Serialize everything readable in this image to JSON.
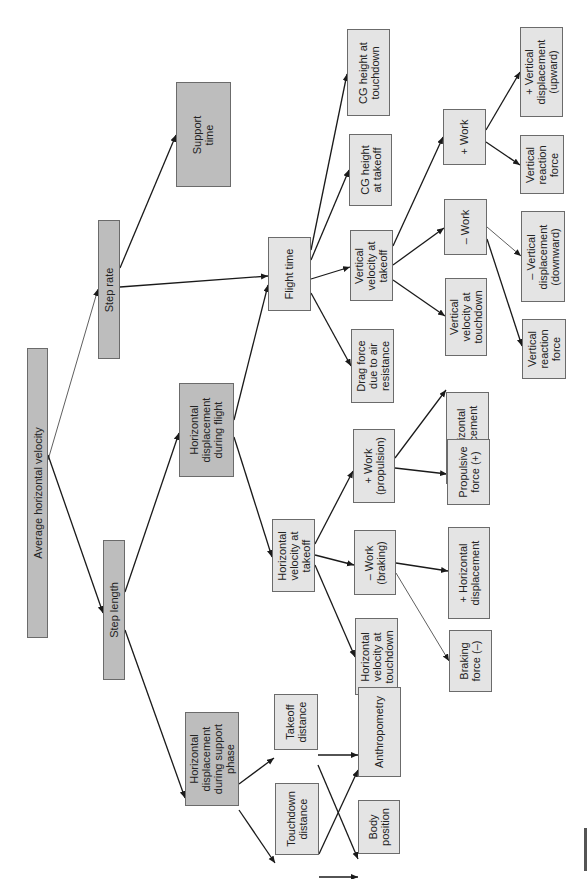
{
  "diagram": {
    "title": "Average horizontal velocity",
    "colors": {
      "primary_fill": "#bdbdbd",
      "secondary_fill": "#e4e4e4",
      "border": "#6b6b6b",
      "edge": "#1a1a1a"
    },
    "orientation": "rotated 90deg counter-clockwise (root at left, leaves at right)",
    "nodes": [
      {
        "id": "avg_h_vel",
        "label": "Average horizontal velocity",
        "style": "dark",
        "x": 27,
        "y": 348,
        "w": 21,
        "h": 290
      },
      {
        "id": "step_rate",
        "label": "Step rate",
        "style": "dark",
        "x": 98,
        "y": 220,
        "w": 22,
        "h": 139
      },
      {
        "id": "step_length",
        "label": "Step length",
        "style": "dark",
        "x": 103,
        "y": 540,
        "w": 22,
        "h": 140
      },
      {
        "id": "support_time",
        "label": "Support\ntime",
        "style": "dark",
        "x": 176,
        "y": 82,
        "w": 55,
        "h": 105
      },
      {
        "id": "hd_flight",
        "label": "Horizontal\ndisplacement\nduring flight",
        "style": "dark",
        "x": 179,
        "y": 383,
        "w": 55,
        "h": 94
      },
      {
        "id": "hd_support",
        "label": "Horizontal\ndisplacement\nduring support\nphase",
        "style": "dark",
        "x": 185,
        "y": 712,
        "w": 54,
        "h": 94
      },
      {
        "id": "flight_time",
        "label": "Flight time",
        "style": "light",
        "x": 268,
        "y": 237,
        "w": 43,
        "h": 74
      },
      {
        "id": "hv_takeoff",
        "label": "Horizontal\nvelocity at\ntakeoff",
        "style": "light",
        "x": 272,
        "y": 519,
        "w": 43,
        "h": 73
      },
      {
        "id": "takeoff_dist",
        "label": "Takeoff\ndistance",
        "style": "light",
        "x": 274,
        "y": 694,
        "w": 44,
        "h": 56
      },
      {
        "id": "touchdown_dist",
        "label": "Touchdown\ndistance",
        "style": "light",
        "x": 275,
        "y": 783,
        "w": 44,
        "h": 72
      },
      {
        "id": "cg_touchdown",
        "label": "CG height at\ntouchdown",
        "style": "light",
        "x": 347,
        "y": 29,
        "w": 43,
        "h": 87
      },
      {
        "id": "cg_takeoff",
        "label": "CG height\nat takeoff",
        "style": "light",
        "x": 349,
        "y": 134,
        "w": 43,
        "h": 72
      },
      {
        "id": "vv_takeoff",
        "label": "Vertical\nvelocity at\ntakeoff",
        "style": "light",
        "x": 350,
        "y": 230,
        "w": 43,
        "h": 71
      },
      {
        "id": "drag",
        "label": "Drag force\ndue to air\nresistance",
        "style": "light",
        "x": 351,
        "y": 329,
        "w": 43,
        "h": 74
      },
      {
        "id": "work_prop",
        "label": "+ Work\n(propulsion)",
        "style": "light",
        "x": 353,
        "y": 429,
        "w": 42,
        "h": 74
      },
      {
        "id": "work_brake",
        "label": "– Work\n(braking)",
        "style": "light",
        "x": 354,
        "y": 530,
        "w": 42,
        "h": 65
      },
      {
        "id": "hv_touchdown",
        "label": "Horizontal\nvelocity at\ntouchdown",
        "style": "light",
        "x": 355,
        "y": 618,
        "w": 43,
        "h": 77
      },
      {
        "id": "anthropometry",
        "label": "Anthropometry",
        "style": "light",
        "x": 358,
        "y": 687,
        "w": 43,
        "h": 90
      },
      {
        "id": "body_position",
        "label": "Body\nposition",
        "style": "light",
        "x": 358,
        "y": 800,
        "w": 42,
        "h": 54
      },
      {
        "id": "work_plus_v",
        "label": "+ Work",
        "style": "light",
        "x": 443,
        "y": 109,
        "w": 43,
        "h": 56
      },
      {
        "id": "work_minus_v",
        "label": "– Work",
        "style": "light",
        "x": 444,
        "y": 199,
        "w": 43,
        "h": 56
      },
      {
        "id": "vv_touchdown",
        "label": "Vertical\nvelocity at\ntouchdown",
        "style": "light",
        "x": 445,
        "y": 278,
        "w": 42,
        "h": 78
      },
      {
        "id": "plus_hd_1",
        "label": "+ Horizontal\ndisplacement",
        "style": "light",
        "x": 446,
        "y": 392,
        "w": 43,
        "h": 92
      },
      {
        "id": "propulsive_force",
        "label": "Propulsive\nforce (+)",
        "style": "light",
        "x": 447,
        "y": 439,
        "w": 43,
        "h": 66
      },
      {
        "id": "plus_hd_2",
        "label": "+ Horizontal\ndisplacement",
        "style": "light",
        "x": 448,
        "y": 527,
        "w": 42,
        "h": 92
      },
      {
        "id": "braking_force",
        "label": "Braking\nforce (–)",
        "style": "light",
        "x": 449,
        "y": 630,
        "w": 43,
        "h": 62
      },
      {
        "id": "plus_vd_up",
        "label": "+ Vertical\ndisplacement\n(upward)",
        "style": "light",
        "x": 520,
        "y": 27,
        "w": 43,
        "h": 90
      },
      {
        "id": "vrf_1",
        "label": "Vertical\nreaction\nforce",
        "style": "light",
        "x": 520,
        "y": 135,
        "w": 44,
        "h": 59
      },
      {
        "id": "minus_vd_down",
        "label": "– Vertical\ndisplacement\n(downward)",
        "style": "light",
        "x": 521,
        "y": 211,
        "w": 44,
        "h": 91
      },
      {
        "id": "vrf_2",
        "label": "Vertical\nreaction\nforce",
        "style": "light",
        "x": 522,
        "y": 319,
        "w": 44,
        "h": 60
      }
    ],
    "edges": [
      {
        "from": "avg_h_vel",
        "to": "step_rate",
        "x1": 48,
        "y1": 460,
        "x2": 98,
        "y2": 289,
        "thin": true
      },
      {
        "from": "avg_h_vel",
        "to": "step_length",
        "x1": 48,
        "y1": 455,
        "x2": 103,
        "y2": 613
      },
      {
        "from": "step_rate",
        "to": "support_time",
        "x1": 120,
        "y1": 268,
        "x2": 176,
        "y2": 135
      },
      {
        "from": "step_rate",
        "to": "flight_time",
        "x1": 120,
        "y1": 287,
        "x2": 268,
        "y2": 276
      },
      {
        "from": "hd_flight",
        "to": "flight_time",
        "x1": 234,
        "y1": 420,
        "x2": 268,
        "y2": 285
      },
      {
        "from": "step_length",
        "to": "hd_flight",
        "x1": 125,
        "y1": 592,
        "x2": 179,
        "y2": 433
      },
      {
        "from": "step_length",
        "to": "hd_support",
        "x1": 125,
        "y1": 630,
        "x2": 185,
        "y2": 798
      },
      {
        "from": "hd_flight",
        "to": "hv_takeoff",
        "x1": 234,
        "y1": 437,
        "x2": 272,
        "y2": 557
      },
      {
        "from": "flight_time",
        "to": "cg_touchdown",
        "x1": 311,
        "y1": 250,
        "x2": 347,
        "y2": 74
      },
      {
        "from": "flight_time",
        "to": "cg_takeoff",
        "x1": 311,
        "y1": 260,
        "x2": 349,
        "y2": 170
      },
      {
        "from": "flight_time",
        "to": "vv_takeoff",
        "x1": 311,
        "y1": 279,
        "x2": 350,
        "y2": 267
      },
      {
        "from": "flight_time",
        "to": "drag",
        "x1": 311,
        "y1": 293,
        "x2": 351,
        "y2": 366
      },
      {
        "from": "vv_takeoff",
        "to": "work_plus_v",
        "x1": 393,
        "y1": 246,
        "x2": 443,
        "y2": 137
      },
      {
        "from": "vv_takeoff",
        "to": "work_minus_v",
        "x1": 393,
        "y1": 265,
        "x2": 444,
        "y2": 228
      },
      {
        "from": "vv_takeoff",
        "to": "vv_touchdown",
        "x1": 393,
        "y1": 280,
        "x2": 445,
        "y2": 316
      },
      {
        "from": "work_plus_v",
        "to": "plus_vd_up",
        "x1": 486,
        "y1": 130,
        "x2": 520,
        "y2": 72
      },
      {
        "from": "work_plus_v",
        "to": "vrf_1",
        "x1": 486,
        "y1": 142,
        "x2": 520,
        "y2": 165
      },
      {
        "from": "work_minus_v",
        "to": "minus_vd_down",
        "x1": 487,
        "y1": 227,
        "x2": 521,
        "y2": 256,
        "thin": true
      },
      {
        "from": "work_minus_v",
        "to": "vrf_2",
        "x1": 487,
        "y1": 239,
        "x2": 522,
        "y2": 346
      },
      {
        "from": "hv_takeoff",
        "to": "work_prop",
        "x1": 315,
        "y1": 544,
        "x2": 353,
        "y2": 471
      },
      {
        "from": "hv_takeoff",
        "to": "work_brake",
        "x1": 315,
        "y1": 555,
        "x2": 354,
        "y2": 565
      },
      {
        "from": "hv_takeoff",
        "to": "hv_touchdown",
        "x1": 315,
        "y1": 565,
        "x2": 355,
        "y2": 657
      },
      {
        "from": "work_prop",
        "to": "plus_hd_1",
        "x1": 395,
        "y1": 458,
        "x2": 446,
        "y2": 390
      },
      {
        "from": "work_prop",
        "to": "propulsive_force",
        "x1": 395,
        "y1": 468,
        "x2": 447,
        "y2": 474
      },
      {
        "from": "work_brake",
        "to": "plus_hd_2",
        "x1": 396,
        "y1": 563,
        "x2": 448,
        "y2": 571
      },
      {
        "from": "work_brake",
        "to": "braking_force",
        "x1": 396,
        "y1": 573,
        "x2": 449,
        "y2": 661,
        "thin": true
      },
      {
        "from": "hd_support",
        "to": "takeoff_dist",
        "x1": 239,
        "y1": 784,
        "x2": 274,
        "y2": 758
      },
      {
        "from": "hd_support",
        "to": "touchdown_dist",
        "x1": 239,
        "y1": 810,
        "x2": 275,
        "y2": 863
      },
      {
        "from": "takeoff_dist",
        "to": "anthropometry",
        "x1": 318,
        "y1": 755,
        "x2": 358,
        "y2": 755
      },
      {
        "from": "takeoff_dist",
        "to": "body_position",
        "x1": 318,
        "y1": 765,
        "x2": 358,
        "y2": 859
      },
      {
        "from": "touchdown_dist",
        "to": "anthropometry",
        "x1": 319,
        "y1": 854,
        "x2": 358,
        "y2": 770
      },
      {
        "from": "touchdown_dist",
        "to": "body_position",
        "x1": 319,
        "y1": 877,
        "x2": 358,
        "y2": 877
      }
    ]
  }
}
